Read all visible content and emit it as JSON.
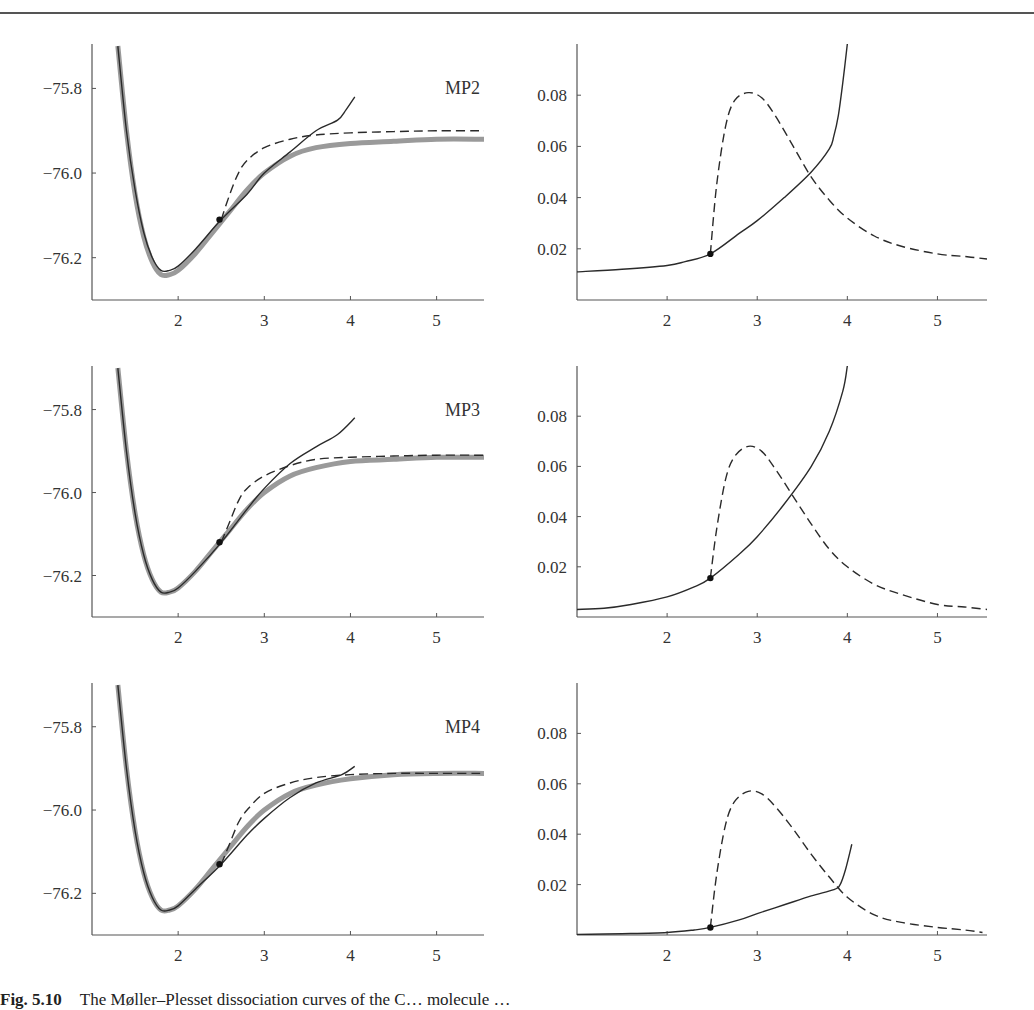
{
  "caption": {
    "label": "Fig. 5.10",
    "text": "The Møller–Plesset dissociation curves of the C… molecule …"
  },
  "colors": {
    "axis": "#555555",
    "solid": "#2a2a2a",
    "dashed": "#2a2a2a",
    "reference": "#9a9a9a",
    "marker": "#111111"
  },
  "chart_data": [
    {
      "type": "line",
      "panel": "MP2-energy",
      "title": "MP2",
      "xlabel": "",
      "ylabel": "",
      "xlim": [
        1.0,
        5.55
      ],
      "ylim": [
        -76.3,
        -75.7
      ],
      "xticks": [
        "2",
        "3",
        "4",
        "5"
      ],
      "yticks": [
        "-75.8",
        "-76.0",
        "-76.2"
      ],
      "series": [
        {
          "name": "reference (gray)",
          "style": "gray-thick",
          "x": [
            1.3,
            1.4,
            1.5,
            1.6,
            1.7,
            1.8,
            1.9,
            2.0,
            2.2,
            2.4,
            2.6,
            2.8,
            3.0,
            3.3,
            3.6,
            4.0,
            4.5,
            5.0,
            5.55
          ],
          "y": [
            -75.7,
            -75.9,
            -76.05,
            -76.15,
            -76.21,
            -76.24,
            -76.24,
            -76.23,
            -76.19,
            -76.14,
            -76.09,
            -76.04,
            -76.0,
            -75.96,
            -75.94,
            -75.93,
            -75.925,
            -75.92,
            -75.92
          ]
        },
        {
          "name": "RHF-based (solid)",
          "style": "solid",
          "x": [
            1.3,
            1.4,
            1.5,
            1.6,
            1.7,
            1.8,
            1.9,
            2.0,
            2.2,
            2.5,
            2.8,
            3.0,
            3.3,
            3.6,
            3.85,
            3.95,
            4.05
          ],
          "y": [
            -75.7,
            -75.9,
            -76.04,
            -76.14,
            -76.2,
            -76.23,
            -76.23,
            -76.22,
            -76.18,
            -76.11,
            -76.05,
            -76.0,
            -75.95,
            -75.9,
            -75.875,
            -75.85,
            -75.82
          ]
        },
        {
          "name": "UHF-based (dashed)",
          "style": "dashed",
          "x": [
            2.5,
            2.6,
            2.7,
            2.8,
            3.0,
            3.3,
            3.6,
            4.0,
            4.5,
            5.0,
            5.55
          ],
          "y": [
            -76.11,
            -76.05,
            -76.0,
            -75.97,
            -75.94,
            -75.92,
            -75.91,
            -75.905,
            -75.902,
            -75.9,
            -75.9
          ]
        }
      ],
      "marker": {
        "x": 2.48,
        "y": -76.11
      }
    },
    {
      "type": "line",
      "panel": "MP2-difference",
      "title": "",
      "xlim": [
        1.0,
        5.55
      ],
      "ylim": [
        0,
        0.1
      ],
      "xticks": [
        "2",
        "3",
        "4",
        "5"
      ],
      "yticks": [
        "0.02",
        "0.04",
        "0.06",
        "0.08"
      ],
      "series": [
        {
          "name": "solid",
          "style": "solid",
          "x": [
            1.0,
            1.5,
            2.0,
            2.2,
            2.48,
            2.8,
            3.0,
            3.3,
            3.6,
            3.8,
            3.85,
            3.9,
            3.95,
            4.0
          ],
          "y": [
            0.011,
            0.012,
            0.0135,
            0.015,
            0.018,
            0.026,
            0.031,
            0.04,
            0.05,
            0.059,
            0.064,
            0.072,
            0.085,
            0.1
          ]
        },
        {
          "name": "dashed",
          "style": "dashed",
          "x": [
            2.48,
            2.55,
            2.65,
            2.75,
            2.9,
            3.05,
            3.2,
            3.4,
            3.6,
            3.8,
            4.0,
            4.3,
            4.6,
            5.0,
            5.3,
            5.55
          ],
          "y": [
            0.018,
            0.045,
            0.068,
            0.078,
            0.081,
            0.079,
            0.072,
            0.06,
            0.048,
            0.039,
            0.032,
            0.025,
            0.021,
            0.018,
            0.017,
            0.016
          ]
        }
      ],
      "marker": {
        "x": 2.48,
        "y": 0.018
      }
    },
    {
      "type": "line",
      "panel": "MP3-energy",
      "title": "MP3",
      "xlim": [
        1.0,
        5.55
      ],
      "ylim": [
        -76.3,
        -75.7
      ],
      "xticks": [
        "2",
        "3",
        "4",
        "5"
      ],
      "yticks": [
        "-75.8",
        "-76.0",
        "-76.2"
      ],
      "series": [
        {
          "name": "reference (gray)",
          "style": "gray-thick",
          "x": [
            1.3,
            1.4,
            1.5,
            1.6,
            1.7,
            1.8,
            1.9,
            2.0,
            2.2,
            2.4,
            2.6,
            2.8,
            3.0,
            3.3,
            3.6,
            4.0,
            4.5,
            5.0,
            5.55
          ],
          "y": [
            -75.7,
            -75.9,
            -76.05,
            -76.15,
            -76.21,
            -76.24,
            -76.24,
            -76.23,
            -76.19,
            -76.14,
            -76.09,
            -76.04,
            -76.0,
            -75.96,
            -75.94,
            -75.925,
            -75.92,
            -75.915,
            -75.915
          ]
        },
        {
          "name": "RHF-based (solid)",
          "style": "solid",
          "x": [
            1.3,
            1.4,
            1.5,
            1.6,
            1.7,
            1.8,
            1.9,
            2.0,
            2.2,
            2.5,
            2.8,
            3.0,
            3.3,
            3.6,
            3.85,
            4.05
          ],
          "y": [
            -75.7,
            -75.9,
            -76.05,
            -76.15,
            -76.21,
            -76.24,
            -76.24,
            -76.23,
            -76.19,
            -76.12,
            -76.04,
            -75.99,
            -75.93,
            -75.89,
            -75.86,
            -75.82
          ]
        },
        {
          "name": "UHF-based (dashed)",
          "style": "dashed",
          "x": [
            2.5,
            2.6,
            2.7,
            2.8,
            3.0,
            3.3,
            3.6,
            4.0,
            4.5,
            5.0,
            5.55
          ],
          "y": [
            -76.12,
            -76.07,
            -76.02,
            -75.99,
            -75.96,
            -75.935,
            -75.92,
            -75.915,
            -75.912,
            -75.91,
            -75.91
          ]
        }
      ],
      "marker": {
        "x": 2.48,
        "y": -76.12
      }
    },
    {
      "type": "line",
      "panel": "MP3-difference",
      "title": "",
      "xlim": [
        1.0,
        5.55
      ],
      "ylim": [
        0,
        0.1
      ],
      "xticks": [
        "2",
        "3",
        "4",
        "5"
      ],
      "yticks": [
        "0.02",
        "0.04",
        "0.06",
        "0.08"
      ],
      "series": [
        {
          "name": "solid",
          "style": "solid",
          "x": [
            1.0,
            1.3,
            1.6,
            2.0,
            2.3,
            2.48,
            2.8,
            3.0,
            3.3,
            3.6,
            3.8,
            3.95,
            4.0
          ],
          "y": [
            0.003,
            0.0035,
            0.005,
            0.008,
            0.012,
            0.0155,
            0.025,
            0.032,
            0.045,
            0.06,
            0.074,
            0.09,
            0.1
          ]
        },
        {
          "name": "dashed",
          "style": "dashed",
          "x": [
            2.48,
            2.55,
            2.65,
            2.75,
            2.9,
            3.05,
            3.2,
            3.4,
            3.6,
            3.8,
            4.0,
            4.3,
            4.6,
            5.0,
            5.3,
            5.55
          ],
          "y": [
            0.0155,
            0.035,
            0.055,
            0.064,
            0.068,
            0.066,
            0.059,
            0.048,
            0.037,
            0.027,
            0.02,
            0.013,
            0.009,
            0.005,
            0.004,
            0.003
          ]
        }
      ],
      "marker": {
        "x": 2.48,
        "y": 0.0155
      }
    },
    {
      "type": "line",
      "panel": "MP4-energy",
      "title": "MP4",
      "xlim": [
        1.0,
        5.55
      ],
      "ylim": [
        -76.3,
        -75.7
      ],
      "xticks": [
        "2",
        "3",
        "4",
        "5"
      ],
      "yticks": [
        "-75.8",
        "-76.0",
        "-76.2"
      ],
      "series": [
        {
          "name": "reference (gray)",
          "style": "gray-thick",
          "x": [
            1.3,
            1.4,
            1.5,
            1.6,
            1.7,
            1.8,
            1.9,
            2.0,
            2.2,
            2.4,
            2.6,
            2.8,
            3.0,
            3.3,
            3.6,
            4.0,
            4.5,
            5.0,
            5.55
          ],
          "y": [
            -75.7,
            -75.9,
            -76.05,
            -76.15,
            -76.21,
            -76.24,
            -76.24,
            -76.23,
            -76.19,
            -76.14,
            -76.09,
            -76.04,
            -76.0,
            -75.96,
            -75.94,
            -75.925,
            -75.915,
            -75.912,
            -75.912
          ]
        },
        {
          "name": "RHF-based (solid)",
          "style": "solid",
          "x": [
            1.3,
            1.4,
            1.5,
            1.6,
            1.7,
            1.8,
            1.9,
            2.0,
            2.2,
            2.5,
            2.8,
            3.0,
            3.3,
            3.6,
            3.9,
            4.05
          ],
          "y": [
            -75.7,
            -75.9,
            -76.05,
            -76.15,
            -76.21,
            -76.24,
            -76.24,
            -76.23,
            -76.19,
            -76.13,
            -76.06,
            -76.02,
            -75.97,
            -75.935,
            -75.915,
            -75.895
          ]
        },
        {
          "name": "UHF-based (dashed)",
          "style": "dashed",
          "x": [
            2.5,
            2.6,
            2.7,
            2.8,
            3.0,
            3.3,
            3.6,
            4.0,
            4.5,
            5.0,
            5.55
          ],
          "y": [
            -76.13,
            -76.08,
            -76.03,
            -76.0,
            -75.96,
            -75.935,
            -75.922,
            -75.915,
            -75.912,
            -75.912,
            -75.912
          ]
        }
      ],
      "marker": {
        "x": 2.48,
        "y": -76.13
      }
    },
    {
      "type": "line",
      "panel": "MP4-difference",
      "title": "",
      "xlim": [
        1.0,
        5.55
      ],
      "ylim": [
        0,
        0.1
      ],
      "xticks": [
        "2",
        "3",
        "4",
        "5"
      ],
      "yticks": [
        "0.02",
        "0.04",
        "0.06",
        "0.08"
      ],
      "series": [
        {
          "name": "solid",
          "style": "solid",
          "x": [
            1.0,
            1.5,
            2.0,
            2.3,
            2.48,
            2.8,
            3.0,
            3.3,
            3.6,
            3.85,
            3.92,
            3.98,
            4.05
          ],
          "y": [
            0.0002,
            0.0005,
            0.001,
            0.002,
            0.003,
            0.006,
            0.0085,
            0.012,
            0.0155,
            0.018,
            0.02,
            0.026,
            0.036
          ]
        },
        {
          "name": "dashed",
          "style": "dashed",
          "x": [
            2.48,
            2.55,
            2.65,
            2.75,
            2.9,
            3.05,
            3.2,
            3.4,
            3.6,
            3.8,
            4.0,
            4.3,
            4.6,
            5.0,
            5.3,
            5.5
          ],
          "y": [
            0.003,
            0.024,
            0.044,
            0.053,
            0.057,
            0.056,
            0.051,
            0.042,
            0.032,
            0.023,
            0.015,
            0.008,
            0.005,
            0.003,
            0.002,
            0.001
          ]
        }
      ],
      "marker": {
        "x": 2.48,
        "y": 0.003
      }
    }
  ]
}
